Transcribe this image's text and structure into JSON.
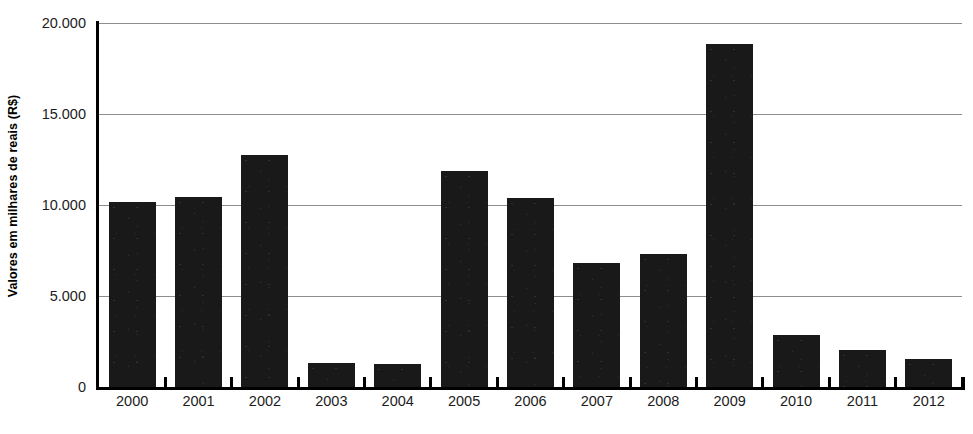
{
  "chart_data": {
    "type": "bar",
    "title": "",
    "subtitle": "",
    "xlabel": "",
    "ylabel": "Valores em milhares de reais (R$)",
    "categories": [
      "2000",
      "2001",
      "2002",
      "2003",
      "2004",
      "2005",
      "2006",
      "2007",
      "2008",
      "2009",
      "2010",
      "2011",
      "2012"
    ],
    "values": [
      10150,
      10450,
      12750,
      1320,
      1280,
      11850,
      10400,
      6820,
      7320,
      18850,
      2850,
      2050,
      1520
    ],
    "series": [
      {
        "name": "Valores em milhares de reais (R$)",
        "values": [
          10150,
          10450,
          12750,
          1320,
          1280,
          11850,
          10400,
          6820,
          7320,
          18850,
          2850,
          2050,
          1520
        ]
      }
    ],
    "ylim": [
      0,
      20000
    ],
    "ytick_values": [
      0,
      5000,
      10000,
      15000,
      20000
    ],
    "ytick_labels": [
      "0",
      "5.000",
      "10.000",
      "15.000",
      "20.000"
    ],
    "grid": true,
    "grid_axis": "y",
    "legend": false,
    "legend_position": "none",
    "bar_color": "#191919",
    "gridline_color": "#8d8d8d",
    "axis_color": "#000000",
    "background_color": "#ffffff"
  },
  "caption": {
    "text": ""
  }
}
